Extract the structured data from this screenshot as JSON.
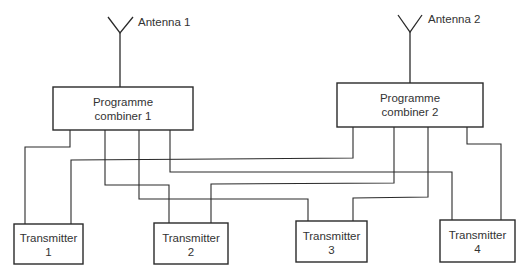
{
  "antennas": [
    {
      "id": "antenna-1",
      "label": "Antenna 1"
    },
    {
      "id": "antenna-2",
      "label": "Antenna 2"
    }
  ],
  "combiners": [
    {
      "id": "combiner-1",
      "line1": "Programme",
      "line2": "combiner 1"
    },
    {
      "id": "combiner-2",
      "line1": "Programme",
      "line2": "combiner 2"
    }
  ],
  "transmitters": [
    {
      "id": "transmitter-1",
      "line1": "Transmitter",
      "line2": "1"
    },
    {
      "id": "transmitter-2",
      "line1": "Transmitter",
      "line2": "2"
    },
    {
      "id": "transmitter-3",
      "line1": "Transmitter",
      "line2": "3"
    },
    {
      "id": "transmitter-4",
      "line1": "Transmitter",
      "line2": "4"
    }
  ],
  "connections": [
    {
      "from": "combiner-1",
      "to": "transmitter-1"
    },
    {
      "from": "combiner-1",
      "to": "transmitter-2"
    },
    {
      "from": "combiner-1",
      "to": "transmitter-3"
    },
    {
      "from": "combiner-1",
      "to": "transmitter-4"
    },
    {
      "from": "combiner-2",
      "to": "transmitter-1"
    },
    {
      "from": "combiner-2",
      "to": "transmitter-2"
    },
    {
      "from": "combiner-2",
      "to": "transmitter-3"
    },
    {
      "from": "combiner-2",
      "to": "transmitter-4"
    },
    {
      "from": "antenna-1",
      "to": "combiner-1"
    },
    {
      "from": "antenna-2",
      "to": "combiner-2"
    }
  ],
  "colors": {
    "line": "#2a2a2a",
    "text": "#333333",
    "background": "#ffffff"
  }
}
